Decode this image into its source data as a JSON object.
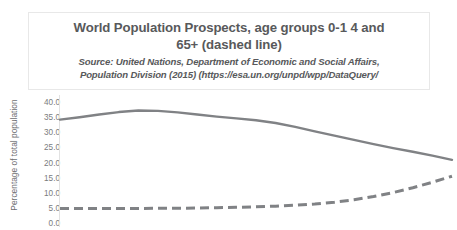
{
  "chart_data": {
    "type": "line",
    "title": "World Population Prospects, age groups 0-1 4 and 65+ (dashed line)",
    "title_line1": "World Population Prospects, age groups 0-1 4 and",
    "title_line2": "65+ (dashed line)",
    "source_line1": "Source: United Nations, Department of Economic and Social Affairs,",
    "source_line2": "Population Division (2015) (https://esa.un.org/unpd/wpp/DataQuery/",
    "xlabel": "",
    "ylabel": "Percentage of total population",
    "ylim": [
      0.0,
      40.0
    ],
    "ytick_labels": [
      "40.0",
      "35.0",
      "30.0",
      "25.0",
      "20.0",
      "15.0",
      "10.0",
      "5.0",
      "0.0"
    ],
    "ytick_values": [
      40.0,
      35.0,
      30.0,
      25.0,
      20.0,
      15.0,
      10.0,
      5.0,
      0.0
    ],
    "grid": false,
    "legend": "none",
    "x": [
      0,
      5,
      10,
      15,
      20,
      25,
      30,
      35,
      40,
      45,
      50,
      55,
      60,
      65,
      70,
      75,
      80,
      85,
      90,
      95,
      100
    ],
    "series": [
      {
        "name": "age group 0-14",
        "style": "solid",
        "color": "#808285",
        "values": [
          34.5,
          35.3,
          36.2,
          37.0,
          37.5,
          37.4,
          36.9,
          36.2,
          35.5,
          34.9,
          34.3,
          33.4,
          32.1,
          30.6,
          29.2,
          27.8,
          26.4,
          25.1,
          23.9,
          22.6,
          21.2
        ]
      },
      {
        "name": "age group 65+",
        "style": "dashed",
        "color": "#808285",
        "values": [
          5.1,
          5.1,
          5.1,
          5.1,
          5.1,
          5.2,
          5.2,
          5.3,
          5.4,
          5.5,
          5.7,
          5.9,
          6.2,
          6.6,
          7.2,
          8.0,
          9.1,
          10.4,
          12.0,
          13.8,
          15.8
        ]
      }
    ]
  }
}
